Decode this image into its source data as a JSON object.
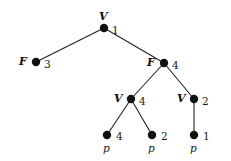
{
  "figure": {
    "type": "tree-diagram",
    "width": 231,
    "height": 161,
    "background_color": "#ffffff",
    "node_color": "#111111",
    "edge_color": "#222222",
    "node_radius": 4.2,
    "edge_width": 1.1
  },
  "nodes": [
    {
      "id": "n1",
      "label": "V",
      "value": "1",
      "sub": "",
      "x": 104,
      "y": 28,
      "label_x": 99,
      "label_y": 11,
      "value_x": 112,
      "value_y": 25,
      "role": "root"
    },
    {
      "id": "n2",
      "label": "F",
      "value": "3",
      "sub": "",
      "x": 36,
      "y": 62,
      "label_x": 19,
      "label_y": 56,
      "value_x": 44,
      "value_y": 59,
      "role": "internal-leafless"
    },
    {
      "id": "n3",
      "label": "F",
      "value": "4",
      "sub": "",
      "x": 164,
      "y": 63,
      "label_x": 147,
      "label_y": 57,
      "value_x": 172,
      "value_y": 60,
      "role": "internal"
    },
    {
      "id": "n4",
      "label": "V",
      "value": "4",
      "sub": "",
      "x": 131,
      "y": 99,
      "label_x": 114,
      "label_y": 93,
      "value_x": 139,
      "value_y": 96,
      "role": "internal"
    },
    {
      "id": "n5",
      "label": "V",
      "value": "2",
      "sub": "",
      "x": 194,
      "y": 99,
      "label_x": 177,
      "label_y": 93,
      "value_x": 202,
      "value_y": 96,
      "role": "internal"
    },
    {
      "id": "n6",
      "label": "",
      "value": "4",
      "sub": "p",
      "x": 107,
      "y": 135,
      "label_x": 0,
      "label_y": 0,
      "value_x": 116,
      "value_y": 131,
      "sub_x": 103,
      "sub_y": 143,
      "role": "leaf"
    },
    {
      "id": "n7",
      "label": "",
      "value": "2",
      "sub": "p",
      "x": 152,
      "y": 135,
      "label_x": 0,
      "label_y": 0,
      "value_x": 161,
      "value_y": 131,
      "sub_x": 148,
      "sub_y": 143,
      "role": "leaf"
    },
    {
      "id": "n8",
      "label": "",
      "value": "1",
      "sub": "p",
      "x": 194,
      "y": 135,
      "label_x": 0,
      "label_y": 0,
      "value_x": 203,
      "value_y": 131,
      "sub_x": 190,
      "sub_y": 143,
      "role": "leaf"
    }
  ],
  "edges": [
    {
      "id": "e1",
      "from": "n1",
      "to": "n2",
      "x1": 104,
      "y1": 28,
      "x2": 36,
      "y2": 62
    },
    {
      "id": "e2",
      "from": "n1",
      "to": "n3",
      "x1": 104,
      "y1": 28,
      "x2": 164,
      "y2": 63
    },
    {
      "id": "e3",
      "from": "n3",
      "to": "n4",
      "x1": 164,
      "y1": 63,
      "x2": 131,
      "y2": 99
    },
    {
      "id": "e4",
      "from": "n3",
      "to": "n5",
      "x1": 164,
      "y1": 63,
      "x2": 194,
      "y2": 99
    },
    {
      "id": "e5",
      "from": "n4",
      "to": "n6",
      "x1": 131,
      "y1": 99,
      "x2": 107,
      "y2": 135
    },
    {
      "id": "e6",
      "from": "n4",
      "to": "n7",
      "x1": 131,
      "y1": 99,
      "x2": 152,
      "y2": 135
    },
    {
      "id": "e7",
      "from": "n5",
      "to": "n8",
      "x1": 194,
      "y1": 99,
      "x2": 194,
      "y2": 135
    }
  ]
}
